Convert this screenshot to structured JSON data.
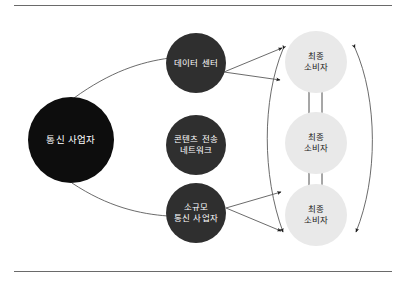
{
  "figure": {
    "name": "telecom-content-delivery-diagram",
    "type": "node-link-diagram",
    "background_color": "#ffffff",
    "rule_color": "#6a6a6a",
    "edge_color": "#555555"
  },
  "nodes": {
    "provider": {
      "id": "telecom-operator",
      "label": "통신 사업자",
      "lines": [
        "통신 사업자"
      ],
      "fill": "#0d0d0d",
      "text_color": "#ffffff"
    },
    "middle": [
      {
        "id": "data-center",
        "label": "데이터 센터",
        "lines": [
          "데이터 센터"
        ],
        "fill": "#2f2f2f",
        "text_color": "#ffffff"
      },
      {
        "id": "content-delivery-network",
        "label": "콘텐츠 전송 네트워크",
        "lines": [
          "콘텐츠 전송",
          "네트워크"
        ],
        "fill": "#2f2f2f",
        "text_color": "#ffffff"
      },
      {
        "id": "small-telecom-operator",
        "label": "소규모 통신 사업자",
        "lines": [
          "소규모",
          "통신 사업자"
        ],
        "fill": "#2f2f2f",
        "text_color": "#ffffff"
      }
    ],
    "consumers": [
      {
        "id": "end-consumer-1",
        "label": "최종 소비자",
        "lines": [
          "최종",
          "소비자"
        ],
        "fill": "#e9e9e9",
        "text_color": "#1a1a1a"
      },
      {
        "id": "end-consumer-2",
        "label": "최종 소비자",
        "lines": [
          "최종",
          "소비자"
        ],
        "fill": "#e9e9e9",
        "text_color": "#1a1a1a"
      },
      {
        "id": "end-consumer-3",
        "label": "최종 소비자",
        "lines": [
          "최종",
          "소비자"
        ],
        "fill": "#e9e9e9",
        "text_color": "#1a1a1a"
      }
    ]
  },
  "edges": [
    {
      "id": "provider-to-data-center",
      "from": "통신 사업자",
      "to": "데이터 센터",
      "style": "curved",
      "arrow": "none"
    },
    {
      "id": "provider-to-small-operator",
      "from": "통신 사업자",
      "to": "소규모 통신 사업자",
      "style": "curved",
      "arrow": "none"
    },
    {
      "id": "data-center-to-consumers",
      "from": "데이터 센터",
      "to": "최종 소비자",
      "style": "straight",
      "arrow": "end"
    },
    {
      "id": "small-operator-to-consumers",
      "from": "소규모 통신 사업자",
      "to": "최종 소비자",
      "style": "straight",
      "arrow": "end"
    },
    {
      "id": "consumer-mesh-inner-arc",
      "from": "최종 소비자",
      "to": "최종 소비자",
      "style": "curved",
      "arrow": "both"
    },
    {
      "id": "consumer-mesh-outer-arc",
      "from": "최종 소비자",
      "to": "최종 소비자",
      "style": "curved",
      "arrow": "both"
    },
    {
      "id": "consumer-1-down-to-2",
      "from": "최종 소비자",
      "to": "최종 소비자",
      "style": "straight",
      "arrow": "end-down"
    },
    {
      "id": "consumer-2-up-to-1",
      "from": "최종 소비자",
      "to": "최종 소비자",
      "style": "straight",
      "arrow": "end-up"
    },
    {
      "id": "consumer-2-down-to-3",
      "from": "최종 소비자",
      "to": "최종 소비자",
      "style": "straight",
      "arrow": "end-down"
    },
    {
      "id": "consumer-3-up-to-2",
      "from": "최종 소비자",
      "to": "최종 소비자",
      "style": "straight",
      "arrow": "end-up"
    }
  ]
}
